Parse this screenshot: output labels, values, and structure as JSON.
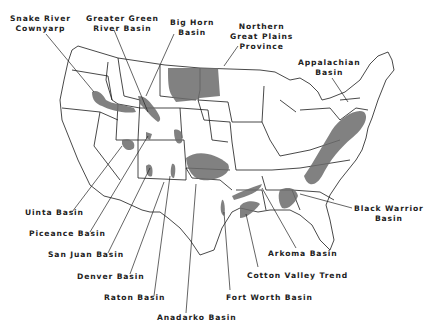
{
  "map": {
    "title": "Tight gas sandstone basins of the United States",
    "fill_color": "#6b6b6b",
    "labels": [
      {
        "id": "snake-river",
        "text": "Snake River Cownyarp",
        "lines": [
          "Snake River",
          "Cownyarp"
        ]
      },
      {
        "id": "greater-green-river",
        "text": "Greater Green River Basin",
        "lines": [
          "Greater Green",
          "River Basin"
        ]
      },
      {
        "id": "big-horn",
        "text": "Big Horn Basin",
        "lines": [
          "Big Horn",
          "Basin"
        ]
      },
      {
        "id": "northern-great-plains",
        "text": "Northern Great Plains Province",
        "lines": [
          "Northern",
          "Great Plains",
          "Province"
        ]
      },
      {
        "id": "appalachian",
        "text": "Appalachian Basin",
        "lines": [
          "Appalachian",
          "Basin"
        ]
      },
      {
        "id": "black-warrior",
        "text": "Black Warrior Basin",
        "lines": [
          "Black Warrior",
          "Basin"
        ]
      },
      {
        "id": "uinta",
        "text": "Uinta Basin",
        "lines": [
          "Uinta Basin"
        ]
      },
      {
        "id": "piceance",
        "text": "Piceance Basin",
        "lines": [
          "Piceance Basin"
        ]
      },
      {
        "id": "san-juan",
        "text": "San Juan Basin",
        "lines": [
          "San Juan Basin"
        ]
      },
      {
        "id": "denver",
        "text": "Denver Basin",
        "lines": [
          "Denver Basin"
        ]
      },
      {
        "id": "raton",
        "text": "Raton Basin",
        "lines": [
          "Raton Basin"
        ]
      },
      {
        "id": "anadarko",
        "text": "Anadarko Basin",
        "lines": [
          "Anadarko Basin"
        ]
      },
      {
        "id": "fort-worth",
        "text": "Fort Worth Basin",
        "lines": [
          "Fort Worth Basin"
        ]
      },
      {
        "id": "cotton-valley",
        "text": "Cotton Valley Trend",
        "lines": [
          "Cotton Valley Trend"
        ]
      },
      {
        "id": "arkoma",
        "text": "Arkoma Basin",
        "lines": [
          "Arkoma Basin"
        ]
      }
    ]
  }
}
